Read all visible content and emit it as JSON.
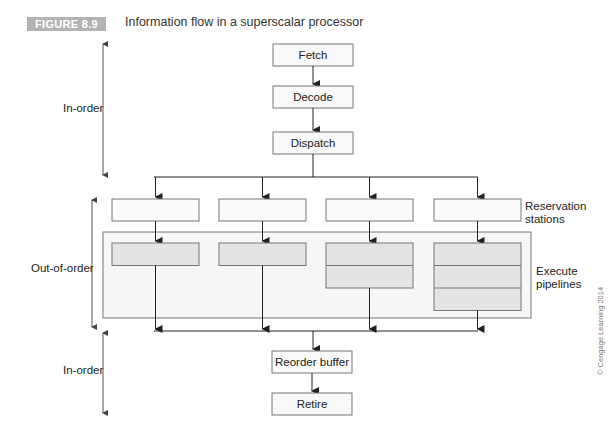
{
  "figure": {
    "badge": "FIGURE 8.9",
    "title": "Information flow in a superscalar processor"
  },
  "stages": {
    "fetch": "Fetch",
    "decode": "Decode",
    "dispatch": "Dispatch",
    "reorder_buffer": "Reorder buffer",
    "retire": "Retire"
  },
  "side_labels": {
    "in_order_top": "In-order",
    "out_of_order": "Out-of-order",
    "in_order_bottom": "In-order"
  },
  "annotations": {
    "reservation_stations": [
      "Reservation",
      "stations"
    ],
    "execute_pipelines": [
      "Execute",
      "pipelines"
    ]
  },
  "pipelines": [
    {
      "name": "pipeline-1",
      "stages": 1
    },
    {
      "name": "pipeline-2",
      "stages": 1
    },
    {
      "name": "pipeline-3",
      "stages": 2
    },
    {
      "name": "pipeline-4",
      "stages": 3
    }
  ],
  "copyright": "© Cengage Learning 2014"
}
